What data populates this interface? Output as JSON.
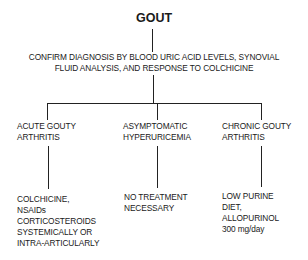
{
  "diagram": {
    "title": "GOUT",
    "diagnosis": {
      "line1": "CONFIRM DIAGNOSIS BY BLOOD URIC ACID LEVELS, SYNOVIAL",
      "line2": "FLUID ANALYSIS, AND RESPONSE TO COLCHICINE"
    },
    "branches": [
      {
        "label": [
          "ACUTE GOUTY",
          "ARTHRITIS"
        ],
        "treatment": [
          "COLCHICINE,",
          "NSAIDs",
          "CORTICOSTEROIDS",
          "SYSTEMICALLY OR",
          "INTRA-ARTICULARLY"
        ]
      },
      {
        "label": [
          "ASYMPTOMATIC",
          "HYPERURICEMIA"
        ],
        "treatment": [
          "NO TREATMENT",
          "NECESSARY"
        ]
      },
      {
        "label": [
          "CHRONIC GOUTY",
          "ARTHRITIS"
        ],
        "treatment": [
          "LOW PURINE",
          "DIET,",
          "ALLOPURINOL",
          "300 mg/day"
        ]
      }
    ]
  }
}
